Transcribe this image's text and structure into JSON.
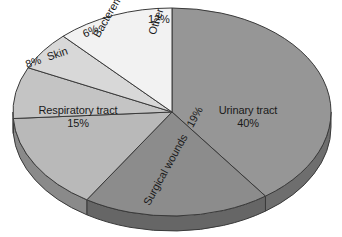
{
  "chart_data": {
    "type": "pie",
    "title": "",
    "subtitle": "",
    "xlabel": "",
    "ylabel": "",
    "legend_position": "none",
    "grid": false,
    "style": "3d-exploded-none",
    "start_angle_deg": 0,
    "direction": "clockwise",
    "categories": [
      "Urinary tract",
      "Surgical wounds",
      "Respiratory tract",
      "Skin",
      "Bacteremia",
      "Other"
    ],
    "values": [
      40,
      19,
      15,
      8,
      6,
      12
    ],
    "value_unit": "%",
    "slices": [
      {
        "label": "Urinary tract",
        "percent_text": "40%",
        "value": 40,
        "top_color": "#969696",
        "side_color": "#6e6e6e"
      },
      {
        "label": "Surgical wounds",
        "percent_text": "19%",
        "value": 19,
        "top_color": "#8c8c8c",
        "side_color": "#666666"
      },
      {
        "label": "Respiratory tract",
        "percent_text": "15%",
        "value": 15,
        "top_color": "#b9b9b9",
        "side_color": "#8a8a8a"
      },
      {
        "label": "Skin",
        "percent_text": "8%",
        "value": 8,
        "top_color": "#c4c4c4",
        "side_color": "#949494"
      },
      {
        "label": "Bacteremia",
        "percent_text": "6%",
        "value": 6,
        "top_color": "#d8d8d8",
        "side_color": "#a4a4a4"
      },
      {
        "label": "Other",
        "percent_text": "12%",
        "value": 12,
        "top_color": "#f2f2f2",
        "side_color": "#c0c0c0"
      }
    ]
  },
  "colors": {
    "background": "#ffffff",
    "outline": "#3a3a3a",
    "text": "#1a1a1a"
  },
  "geometry": {
    "center_x": 172,
    "center_y": 112,
    "radius_x": 159,
    "radius_y": 104,
    "depth": 15
  }
}
